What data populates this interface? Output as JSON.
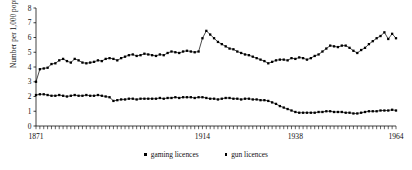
{
  "chart_data": {
    "type": "line",
    "title": "",
    "subtitle": "",
    "xlabel": "",
    "ylabel": "Number per 1,000 population",
    "xlim": [
      1871,
      1964
    ],
    "ylim": [
      0,
      8
    ],
    "yticks": [
      0,
      1,
      2,
      3,
      4,
      5,
      6,
      7,
      8
    ],
    "xticks": [
      1871,
      1914,
      1938,
      1964
    ],
    "xticklabels": [
      "1871",
      "1914",
      "1938",
      "1964"
    ],
    "grid": false,
    "legend_position": "bottom-center",
    "marker": "square",
    "x": [
      1871,
      1872,
      1873,
      1874,
      1875,
      1876,
      1877,
      1878,
      1879,
      1880,
      1881,
      1882,
      1883,
      1884,
      1885,
      1886,
      1887,
      1888,
      1889,
      1890,
      1891,
      1892,
      1893,
      1894,
      1895,
      1896,
      1897,
      1898,
      1899,
      1900,
      1901,
      1902,
      1903,
      1904,
      1905,
      1906,
      1907,
      1908,
      1909,
      1910,
      1911,
      1912,
      1913,
      1914,
      1915,
      1916,
      1917,
      1918,
      1919,
      1920,
      1921,
      1922,
      1923,
      1924,
      1925,
      1926,
      1927,
      1928,
      1929,
      1930,
      1931,
      1932,
      1933,
      1934,
      1935,
      1936,
      1937,
      1938,
      1939,
      1940,
      1941,
      1942,
      1943,
      1944,
      1945,
      1946,
      1947,
      1948,
      1949,
      1950,
      1951,
      1952,
      1953,
      1954,
      1955,
      1956,
      1957,
      1958,
      1959,
      1960,
      1961,
      1962,
      1963,
      1964
    ],
    "series": [
      {
        "name": "gaming licences",
        "color": "#000000",
        "values": [
          3.0,
          3.85,
          3.9,
          3.95,
          4.2,
          4.25,
          4.45,
          4.55,
          4.4,
          4.3,
          4.55,
          4.45,
          4.3,
          4.25,
          4.3,
          4.35,
          4.45,
          4.4,
          4.55,
          4.6,
          4.55,
          4.45,
          4.6,
          4.7,
          4.8,
          4.85,
          4.75,
          4.8,
          4.9,
          4.85,
          4.8,
          4.75,
          4.85,
          4.8,
          4.95,
          5.05,
          5.0,
          4.95,
          5.05,
          5.1,
          5.05,
          5.0,
          5.05,
          5.95,
          6.45,
          6.2,
          5.95,
          5.7,
          5.55,
          5.4,
          5.25,
          5.2,
          5.05,
          4.95,
          4.85,
          4.8,
          4.7,
          4.6,
          4.5,
          4.4,
          4.25,
          4.35,
          4.45,
          4.5,
          4.5,
          4.45,
          4.6,
          4.55,
          4.65,
          4.6,
          4.5,
          4.6,
          4.75,
          4.85,
          5.05,
          5.25,
          5.45,
          5.4,
          5.35,
          5.45,
          5.45,
          5.3,
          5.1,
          4.95,
          5.15,
          5.3,
          5.55,
          5.75,
          5.95,
          6.1,
          6.35,
          5.9,
          6.25,
          5.95
        ]
      },
      {
        "name": "gun licences",
        "color": "#000000",
        "values": [
          2.1,
          2.15,
          2.15,
          2.1,
          2.05,
          2.05,
          2.1,
          2.05,
          2.0,
          2.05,
          2.1,
          2.05,
          2.05,
          2.1,
          2.05,
          2.05,
          2.1,
          2.05,
          2.0,
          1.95,
          1.7,
          1.75,
          1.8,
          1.8,
          1.85,
          1.85,
          1.8,
          1.85,
          1.85,
          1.85,
          1.85,
          1.85,
          1.9,
          1.85,
          1.9,
          1.9,
          1.95,
          1.9,
          1.95,
          1.95,
          1.95,
          1.9,
          1.95,
          1.95,
          1.9,
          1.85,
          1.85,
          1.8,
          1.85,
          1.9,
          1.9,
          1.85,
          1.85,
          1.8,
          1.85,
          1.85,
          1.8,
          1.8,
          1.75,
          1.75,
          1.7,
          1.6,
          1.5,
          1.35,
          1.25,
          1.15,
          1.05,
          0.95,
          0.9,
          0.9,
          0.9,
          0.9,
          0.9,
          0.95,
          0.95,
          1.0,
          1.0,
          0.95,
          0.95,
          0.95,
          0.9,
          0.9,
          0.85,
          0.85,
          0.9,
          0.95,
          1.0,
          1.0,
          1.0,
          1.05,
          1.05,
          1.05,
          1.1,
          1.05
        ]
      }
    ]
  },
  "legend": {
    "items": [
      {
        "label": "gaming licences"
      },
      {
        "label": "gun licences"
      }
    ]
  },
  "axis": {
    "ylabel": "Number per 1,000 population"
  }
}
